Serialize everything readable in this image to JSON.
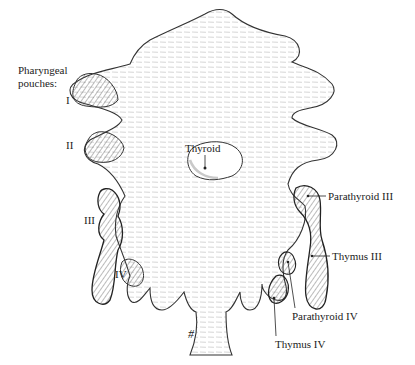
{
  "title_lines": [
    "Pharyngeal",
    "pouches:"
  ],
  "pouch_labels": [
    "I",
    "II",
    "III",
    "IV"
  ],
  "structure_labels": {
    "thyroid": "Thyroid",
    "parathyroid_iii": "Parathyroid III",
    "thymus_iii": "Thymus III",
    "parathyroid_iv": "Parathyroid IV",
    "thymus_iv": "Thymus IV"
  },
  "mark": "#"
}
